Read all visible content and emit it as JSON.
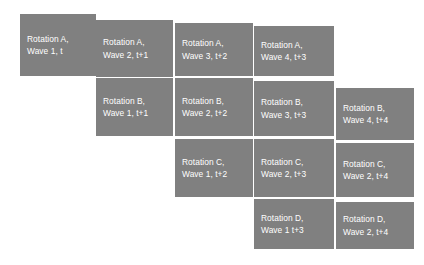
{
  "diagram": {
    "type": "staircase-matrix",
    "background_color": "#ffffff",
    "cell_color": "#808080",
    "cell_text_color": "#ffffff",
    "rows": [
      {
        "name": "Rotation A",
        "cells": [
          {
            "line1": "Rotation A,",
            "line2": "Wave 1, t",
            "rotation": "A",
            "wave": 1,
            "time": "t",
            "column": 1,
            "x": 20,
            "y": 14,
            "w": 76,
            "h": 62
          },
          {
            "line1": "Rotation A,",
            "line2": "Wave 2, t+1",
            "rotation": "A",
            "wave": 2,
            "time": "t+1",
            "column": 2,
            "x": 96,
            "y": 20,
            "w": 77,
            "h": 57
          },
          {
            "line1": "Rotation A,",
            "line2": "Wave 3, t+2",
            "rotation": "A",
            "wave": 3,
            "time": "t+2",
            "column": 3,
            "x": 175,
            "y": 23,
            "w": 78,
            "h": 53
          },
          {
            "line1": "Rotation A,",
            "line2": "Wave 4, t+3",
            "rotation": "A",
            "wave": 4,
            "time": "t+3",
            "column": 4,
            "x": 254,
            "y": 26,
            "w": 80,
            "h": 50
          }
        ]
      },
      {
        "name": "Rotation B",
        "cells": [
          {
            "line1": "Rotation B,",
            "line2": "Wave 1, t+1",
            "rotation": "B",
            "wave": 1,
            "time": "t+1",
            "column": 2,
            "x": 96,
            "y": 78,
            "w": 77,
            "h": 58
          },
          {
            "line1": "Rotation B,",
            "line2": "Wave 2, t+2",
            "rotation": "B",
            "wave": 2,
            "time": "t+2",
            "column": 3,
            "x": 175,
            "y": 78,
            "w": 78,
            "h": 58
          },
          {
            "line1": "Rotation B,",
            "line2": "Wave 3, t+3",
            "rotation": "B",
            "wave": 3,
            "time": "t+3",
            "column": 4,
            "x": 254,
            "y": 81,
            "w": 80,
            "h": 55
          },
          {
            "line1": "Rotation B,",
            "line2": "Wave 4, t+4",
            "rotation": "B",
            "wave": 4,
            "time": "t+4",
            "column": 5,
            "x": 336,
            "y": 88,
            "w": 78,
            "h": 52
          }
        ]
      },
      {
        "name": "Rotation C",
        "cells": [
          {
            "line1": "Rotation C,",
            "line2": "Wave 1, t+2",
            "rotation": "C",
            "wave": 1,
            "time": "t+2",
            "column": 3,
            "x": 175,
            "y": 139,
            "w": 78,
            "h": 58
          },
          {
            "line1": "Rotation C,",
            "line2": "Wave 2, t+3",
            "rotation": "C",
            "wave": 2,
            "time": "t+3",
            "column": 4,
            "x": 254,
            "y": 139,
            "w": 80,
            "h": 58
          },
          {
            "line1": "Rotation C,",
            "line2": "Wave 2, t+4",
            "rotation": "C",
            "wave": 2,
            "time": "t+4",
            "column": 5,
            "x": 336,
            "y": 143,
            "w": 78,
            "h": 54
          }
        ]
      },
      {
        "name": "Rotation D",
        "cells": [
          {
            "line1": "Rotation D,",
            "line2": "Wave 1 t+3",
            "rotation": "D",
            "wave": 1,
            "time": "t+3",
            "column": 4,
            "x": 254,
            "y": 199,
            "w": 80,
            "h": 50
          },
          {
            "line1": "Rotation D,",
            "line2": "Wave 2, t+4",
            "rotation": "D",
            "wave": 2,
            "time": "t+4",
            "column": 5,
            "x": 336,
            "y": 202,
            "w": 78,
            "h": 47
          }
        ]
      }
    ]
  }
}
